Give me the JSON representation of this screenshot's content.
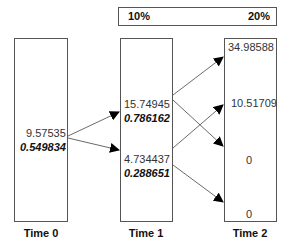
{
  "header": {
    "left_rate": "10%",
    "right_rate": "20%"
  },
  "nodes": {
    "time0": {
      "label": "Time 0",
      "value": "9.57535",
      "prob": "0.549834"
    },
    "time1": {
      "label": "Time 1",
      "upper": {
        "value": "15.74945",
        "prob": "0.786162"
      },
      "lower": {
        "value": "4.734437",
        "prob": "0.288651"
      }
    },
    "time2": {
      "label": "Time 2",
      "values": [
        "34.98588",
        "10.51709",
        "0",
        "0"
      ]
    }
  }
}
